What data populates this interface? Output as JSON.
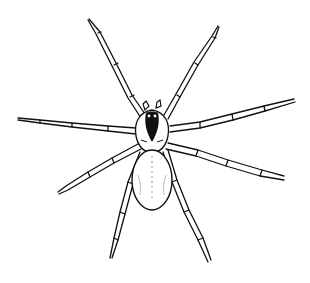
{
  "image": {
    "subject": "spider",
    "style": "black ink line illustration",
    "background": "#ffffff",
    "ink": "#111111"
  }
}
